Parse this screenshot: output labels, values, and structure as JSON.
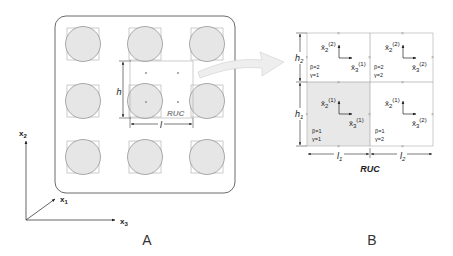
{
  "panels": {
    "a": {
      "label": "A",
      "ruc_label": "RUC",
      "dim_h": "h",
      "dim_l": "l",
      "axes": {
        "x1": "x",
        "x1_sub": "1",
        "x2": "x",
        "x2_sub": "2",
        "x3": "x",
        "x3_sub": "3"
      },
      "grid": {
        "rows": 3,
        "cols": 3
      }
    },
    "b": {
      "label": "B",
      "ruc_label": "RUC",
      "dims": {
        "h1": "h",
        "h1_sub": "1",
        "h2": "h",
        "h2_sub": "2",
        "l1": "l",
        "l1_sub": "1",
        "l2": "l",
        "l2_sub": "2"
      },
      "subcells": [
        {
          "id": "b2g1",
          "beta": "β=2",
          "gamma": "γ=1",
          "x2_sup": "(2)",
          "x3_sup": "(1)",
          "shaded": false
        },
        {
          "id": "b2g2",
          "beta": "β=2",
          "gamma": "γ=2",
          "x2_sup": "(2)",
          "x3_sup": "(2)",
          "shaded": false
        },
        {
          "id": "b1g1",
          "beta": "β=1",
          "gamma": "γ=1",
          "x2_sup": "(1)",
          "x3_sup": "(1)",
          "shaded": true
        },
        {
          "id": "b1g2",
          "beta": "β=1",
          "gamma": "γ=2",
          "x2_sup": "(1)",
          "x3_sup": "(2)",
          "shaded": false
        }
      ],
      "local_axis_x2": "x̄",
      "local_axis_x2_sub": "2",
      "local_axis_x3": "x̄",
      "local_axis_x3_sub": "3"
    }
  },
  "colors": {
    "fiber_fill": "#e6e6e6",
    "fiber_stroke": "#666666",
    "shaded_cell": "#e8e8e8",
    "arrow_fill": "#eeeeee",
    "ruc_label": "#888888"
  }
}
